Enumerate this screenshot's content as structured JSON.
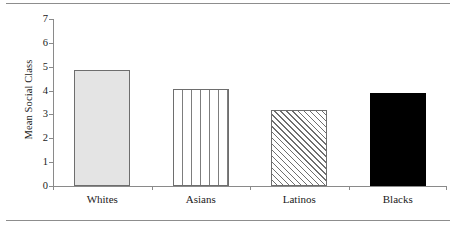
{
  "figure": {
    "name": "mean-social-class-bar-chart",
    "top_rule": true,
    "bottom_rule": true
  },
  "chart_data": {
    "type": "bar",
    "title": "",
    "xlabel": "",
    "ylabel": "Mean Social Class",
    "categories": [
      "Whites",
      "Asians",
      "Latinos",
      "Blacks"
    ],
    "values": [
      4.85,
      4.05,
      3.2,
      3.88
    ],
    "ylim": [
      0,
      7
    ],
    "yticks": [
      0,
      1,
      2,
      3,
      4,
      5,
      6,
      7
    ],
    "ytick_labels": [
      "0",
      "1",
      "2",
      "3",
      "4",
      "5",
      "6",
      "7"
    ],
    "grid": false,
    "legend": "none",
    "series": [
      {
        "name": "Mean Social Class",
        "values": [
          4.85,
          4.05,
          3.2,
          3.88
        ],
        "fills": [
          "solid-gray",
          "vertical-lines",
          "diagonal-hatch",
          "solid-black"
        ]
      }
    ],
    "bars": [
      {
        "category": "Whites",
        "value": 4.85,
        "fill": "solid-gray",
        "fill_color": "#e4e4e4",
        "edge_color": "#6e6e6e"
      },
      {
        "category": "Asians",
        "value": 4.05,
        "fill": "vertical-lines",
        "fill_color": "#ffffff",
        "edge_color": "#6e6e6e"
      },
      {
        "category": "Latinos",
        "value": 3.2,
        "fill": "diagonal-hatch",
        "fill_color": "#ffffff",
        "edge_color": "#6e6e6e"
      },
      {
        "category": "Blacks",
        "value": 3.88,
        "fill": "solid-black",
        "fill_color": "#000000",
        "edge_color": "#000000"
      }
    ],
    "colors": {
      "axis": "#8a8a8a",
      "rule": "#8d8d8d",
      "text": "#1a1a1a",
      "background": "#ffffff"
    }
  }
}
